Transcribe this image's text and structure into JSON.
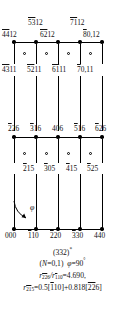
{
  "figure": {
    "title": "(332)*",
    "rows": {
      "top_outer": [
        {
          "id": "t1",
          "text": "5312",
          "overline_digits": "53",
          "rest": "12",
          "x": 28,
          "y": 19
        },
        {
          "id": "t2",
          "text": "7112",
          "overline_digits": "71",
          "rest": "12",
          "x": 70,
          "y": 19
        }
      ],
      "row_4412": [
        {
          "id": "a1",
          "text": "4412",
          "overline_digits": "44",
          "rest": "12",
          "x": 2,
          "y": 31
        },
        {
          "id": "a2",
          "text": "6212",
          "overline_digits": "62",
          "rest": "12",
          "x": 40,
          "y": 31
        },
        {
          "id": "a3",
          "text": "80,12",
          "overline_digits": "8",
          "rest": "0,12",
          "x": 83,
          "y": 31
        }
      ],
      "row_4311": [
        {
          "id": "b1",
          "text": "4311",
          "overline_digits": "43",
          "rest": "11",
          "x": 2,
          "y": 66
        },
        {
          "id": "b2",
          "text": "5211",
          "overline_digits": "52",
          "rest": "11",
          "x": 27,
          "y": 66
        },
        {
          "id": "b3",
          "text": "6111",
          "overline_digits": "61",
          "rest": "11",
          "x": 52,
          "y": 66
        },
        {
          "id": "b4",
          "text": "70,11",
          "overline_digits": "7",
          "rest": "0,11",
          "x": 77,
          "y": 66
        }
      ],
      "row_226": [
        {
          "id": "c1",
          "text": "226",
          "overline_digits": "2",
          "rest": "26",
          "x": 10,
          "y": 125
        },
        {
          "id": "c2",
          "text": "316",
          "overline_digits": "3",
          "rest": "16",
          "x": 32,
          "y": 125
        },
        {
          "id": "c3",
          "text": "406",
          "overline_digits": "",
          "rest": "406",
          "x": 54,
          "y": 125
        },
        {
          "id": "c4",
          "text": "516",
          "overline_digits": "5",
          "rest": "16",
          "x": 76,
          "y": 125
        },
        {
          "id": "c5",
          "text": "626",
          "overline_digits": "6",
          "rest": "26",
          "x": 98,
          "y": 125
        }
      ],
      "row_215": [
        {
          "id": "d1",
          "text": "215",
          "overline_digits": "2",
          "rest": "15",
          "x": 25,
          "y": 165
        },
        {
          "id": "d2",
          "text": "305",
          "overline_digits": "3",
          "rest": "05",
          "x": 45,
          "y": 165
        },
        {
          "id": "d3",
          "text": "415",
          "overline_digits": "4",
          "rest": "15",
          "x": 66,
          "y": 165
        },
        {
          "id": "d4",
          "text": "525",
          "overline_digits": "5",
          "rest": "25",
          "x": 86,
          "y": 165
        }
      ],
      "row_000": [
        {
          "id": "e1",
          "text": "000",
          "overline_digits": "",
          "rest": "000",
          "x": 8,
          "y": 232
        },
        {
          "id": "e2",
          "text": "110",
          "overline_digits": "1",
          "rest": "10",
          "x": 30,
          "y": 232
        },
        {
          "id": "e3",
          "text": "220",
          "overline_digits": "2",
          "rest": "20",
          "x": 52,
          "y": 232
        },
        {
          "id": "e4",
          "text": "330",
          "overline_digits": "3",
          "rest": "30",
          "x": 74,
          "y": 232
        },
        {
          "id": "e5",
          "text": "440",
          "overline_digits": "",
          "rest": "440",
          "x": 95,
          "y": 232
        }
      ]
    },
    "angle_symbol": "φ"
  },
  "caption": {
    "line1_base": "(332)",
    "line1_sup": "*",
    "line2_n": "N",
    "line2_a": "(",
    "line2_b": "=0,1)",
    "line2_phi": "φ",
    "line2_c": "=90",
    "line2_deg": "°",
    "line3_r": "r",
    "line3_sub1_bar": "22",
    "line3_sub1_rest": "6",
    "line3_slash": "/r",
    "line3_sub2_bar": "1",
    "line3_sub2_rest": "10",
    "line3_val": "=4.690,",
    "line4_r": "r",
    "line4_sub_bar": "21",
    "line4_sub_rest": "5",
    "line4_eq": "=0.5[",
    "line4_b1_bar": "1",
    "line4_b1_rest": "10",
    "line4_mid": "]+0.818[",
    "line4_b2_bar": "22",
    "line4_b2_rest": "6",
    "line4_end": "]"
  },
  "colors": {
    "ink": "#111111",
    "line": "#000000",
    "background": "#ffffff"
  }
}
